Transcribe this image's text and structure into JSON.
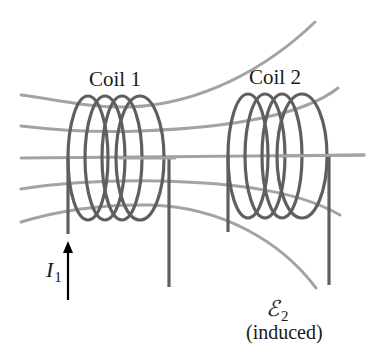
{
  "figure": {
    "type": "mutual inductance diagram",
    "coil1": {
      "label": "Coil 1",
      "turns": 4
    },
    "coil2": {
      "label": "Coil 2",
      "turns": 4
    },
    "current": {
      "symbol": "I",
      "subscript": "1",
      "direction": "up"
    },
    "emf": {
      "symbol": "ℰ",
      "subscript": "2",
      "note": "(induced)"
    },
    "field_lines": 5
  },
  "colors": {
    "field_line": "#a3a3a3",
    "wire": "#5f5f5f",
    "arrow": "#000000",
    "text": "#1a1a1a"
  }
}
